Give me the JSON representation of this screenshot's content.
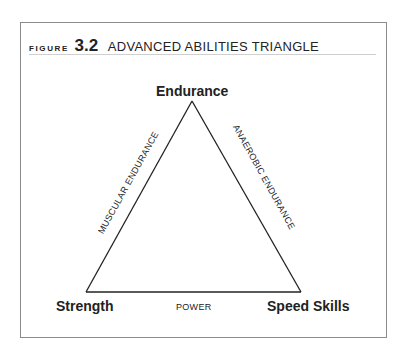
{
  "figure": {
    "label": "FIGURE",
    "number": "3.2",
    "title": "ADVANCED ABILITIES TRIANGLE"
  },
  "vertices": {
    "top": "Endurance",
    "bottom_left": "Strength",
    "bottom_right": "Speed Skills"
  },
  "edges": {
    "left": "MUSCULAR ENDURANCE",
    "right": "ANAEROBIC ENDURANCE",
    "bottom": "POWER"
  }
}
